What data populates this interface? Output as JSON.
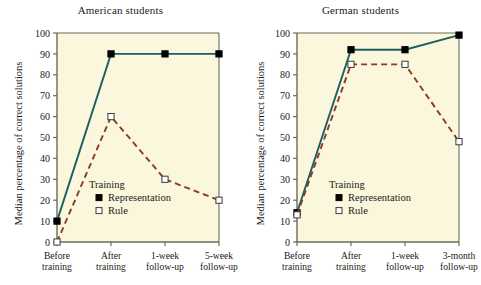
{
  "figure": {
    "background_color": "#ffffff",
    "plot_background_color": "#faf7dc",
    "axis_color": "#6b6b5e"
  },
  "chart_data": [
    {
      "type": "line",
      "title": "American students",
      "xlabel": "",
      "ylabel": "Median percentage of correct solutions",
      "categories": [
        "Before training",
        "After training",
        "1-week follow-up",
        "5-week follow-up"
      ],
      "categories_line1": [
        "Before",
        "After",
        "1-week",
        "5-week"
      ],
      "categories_line2": [
        "training",
        "training",
        "follow-up",
        "follow-up"
      ],
      "ylim": [
        0,
        100
      ],
      "yticks": [
        0,
        10,
        20,
        30,
        40,
        50,
        60,
        70,
        80,
        90,
        100
      ],
      "grid": false,
      "legend_title": "Training",
      "legend_position": "inside-center-lower",
      "series": [
        {
          "name": "Representation",
          "values": [
            10,
            90,
            90,
            90
          ],
          "color": "#1b5e63",
          "line_style": "solid",
          "marker": "filled-square"
        },
        {
          "name": "Rule",
          "values": [
            0,
            60,
            30,
            20
          ],
          "color": "#8b3a28",
          "line_style": "dashed",
          "marker": "open-square"
        }
      ]
    },
    {
      "type": "line",
      "title": "German students",
      "xlabel": "",
      "ylabel": "Median percentage of correct solutions",
      "categories": [
        "Before training",
        "After training",
        "1-week follow-up",
        "3-month follow-up"
      ],
      "categories_line1": [
        "Before",
        "After",
        "1-week",
        "3-month"
      ],
      "categories_line2": [
        "training",
        "training",
        "follow-up",
        "follow-up"
      ],
      "ylim": [
        0,
        100
      ],
      "yticks": [
        0,
        10,
        20,
        30,
        40,
        50,
        60,
        70,
        80,
        90,
        100
      ],
      "grid": false,
      "legend_title": "Training",
      "legend_position": "inside-center-lower",
      "series": [
        {
          "name": "Representation",
          "values": [
            14,
            92,
            92,
            99
          ],
          "color": "#1b5e63",
          "line_style": "solid",
          "marker": "filled-square"
        },
        {
          "name": "Rule",
          "values": [
            13,
            85,
            85,
            48
          ],
          "color": "#8b3a28",
          "line_style": "dashed",
          "marker": "open-square"
        }
      ]
    }
  ]
}
